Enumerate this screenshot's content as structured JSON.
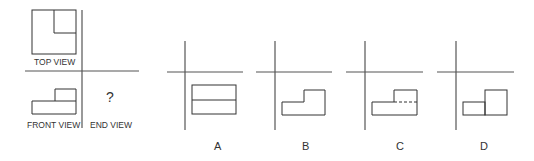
{
  "problem": {
    "labels": {
      "top_view": "TOP VIEW",
      "front_view": "FRONT VIEW",
      "end_view": "END VIEW",
      "unknown": "?"
    }
  },
  "options": [
    {
      "letter": "A"
    },
    {
      "letter": "B"
    },
    {
      "letter": "C"
    },
    {
      "letter": "D"
    }
  ],
  "colors": {
    "line": "#555555",
    "shape": "#333333",
    "background": "#ffffff"
  }
}
